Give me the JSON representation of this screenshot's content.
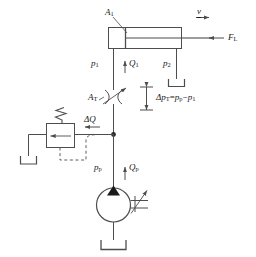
{
  "diagram": {
    "type": "hydraulic-schematic",
    "line_color": "#4d4d4d",
    "text_color": "#1a1a1a",
    "background": "#ffffff"
  },
  "labels": {
    "piston_area": {
      "base": "A",
      "sub": "1",
      "text": "A1"
    },
    "velocity": {
      "base": "v",
      "sub": "",
      "text": "v"
    },
    "load_force": {
      "base": "F",
      "sub": "L",
      "text": "FL"
    },
    "pressure_1": {
      "base": "p",
      "sub": "1",
      "text": "p1"
    },
    "flow_1": {
      "base": "Q",
      "sub": "1",
      "text": "Q1"
    },
    "pressure_2": {
      "base": "p",
      "sub": "2",
      "text": "p2"
    },
    "throttle_area": {
      "base": "A",
      "sub": "T",
      "text": "AT"
    },
    "delta_flow": {
      "base": "ΔQ",
      "sub": "",
      "text": "ΔQ"
    },
    "pressure_pump": {
      "base": "p",
      "sub": "p",
      "text": "pp"
    },
    "flow_pump": {
      "base": "Q",
      "sub": "p",
      "text": "Qp"
    },
    "delta_p_formula": {
      "lhs_base": "Δp",
      "lhs_sub": "T",
      "eq": "=",
      "rhs1_base": "p",
      "rhs1_sub": "p",
      "minus": "−",
      "rhs2_base": "p",
      "rhs2_sub": "1",
      "text": "ΔpT = pp − p1"
    }
  },
  "components": [
    {
      "name": "hydraulic-cylinder",
      "label": "Cylinder with piston, area A1"
    },
    {
      "name": "throttle-valve",
      "label": "Adjustable throttle / restrictor, area AT"
    },
    {
      "name": "pressure-relief-valve",
      "label": "Pressure relief valve with spring and pilot line"
    },
    {
      "name": "hydraulic-pump",
      "label": "Fixed displacement pump with drive shaft"
    },
    {
      "name": "tank-pump",
      "label": "Reservoir below pump"
    },
    {
      "name": "tank-relief",
      "label": "Reservoir at relief valve outlet"
    },
    {
      "name": "tank-return",
      "label": "Reservoir on cylinder return line p2"
    }
  ],
  "icons": {
    "velocity_arrow": "arrow-right-icon",
    "load_arrow": "arrow-left-icon",
    "flow_arrow_q1": "arrow-up-icon",
    "flow_arrow_qp": "arrow-up-icon",
    "delta_q_arrow": "arrow-left-icon",
    "pump_direction": "filled-triangle-icon",
    "dimension_marker": "double-ended-dimension-icon",
    "junction": "node-dot-icon"
  }
}
